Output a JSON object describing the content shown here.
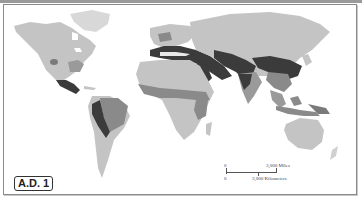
{
  "map": {
    "date_label": "A.D. 1",
    "scale_bar": {
      "zero_top": "0",
      "zero_bottom": "0",
      "miles_label": "3,000 Miles",
      "km_label": "3,000 Kilometers"
    },
    "colors": {
      "background": "#ffffff",
      "land_light": "#c4c4c4",
      "land_medium": "#9a9a9a",
      "land_dark": "#555555",
      "land_darkest": "#3a3a3a",
      "border": "#8a8a8a"
    }
  }
}
